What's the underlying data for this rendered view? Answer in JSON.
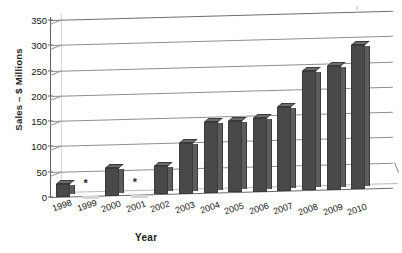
{
  "chart_data": {
    "type": "bar",
    "title": "",
    "xlabel": "Year",
    "ylabel": "Sales – $ Millions",
    "ylim": [
      0,
      350
    ],
    "ytick_step": 50,
    "yticks": [
      "0",
      "50",
      "100",
      "150",
      "200",
      "250",
      "300",
      "350"
    ],
    "grid": true,
    "legend": "none",
    "style": "3d-column",
    "bar_color": "#494949",
    "missing_marker": "*",
    "missing_note": "Asterisk marks years with no reported bar value",
    "categories": [
      "1998",
      "1999",
      "2000",
      "2001",
      "2002",
      "2003",
      "2004",
      "2005",
      "2006",
      "2007",
      "2008",
      "2009",
      "2010"
    ],
    "values": [
      25,
      null,
      55,
      null,
      55,
      100,
      140,
      140,
      145,
      165,
      235,
      245,
      285
    ],
    "points": [
      {
        "category": "1998",
        "value": 25,
        "missing": false,
        "marker": ""
      },
      {
        "category": "1999",
        "value": null,
        "missing": true,
        "marker": "*"
      },
      {
        "category": "2000",
        "value": 55,
        "missing": false,
        "marker": ""
      },
      {
        "category": "2001",
        "value": null,
        "missing": true,
        "marker": "*"
      },
      {
        "category": "2002",
        "value": 55,
        "missing": false,
        "marker": ""
      },
      {
        "category": "2003",
        "value": 100,
        "missing": false,
        "marker": ""
      },
      {
        "category": "2004",
        "value": 140,
        "missing": false,
        "marker": ""
      },
      {
        "category": "2005",
        "value": 140,
        "missing": false,
        "marker": ""
      },
      {
        "category": "2006",
        "value": 145,
        "missing": false,
        "marker": ""
      },
      {
        "category": "2007",
        "value": 165,
        "missing": false,
        "marker": ""
      },
      {
        "category": "2008",
        "value": 235,
        "missing": false,
        "marker": ""
      },
      {
        "category": "2009",
        "value": 245,
        "missing": false,
        "marker": ""
      },
      {
        "category": "2010",
        "value": 285,
        "missing": false,
        "marker": ""
      }
    ]
  }
}
